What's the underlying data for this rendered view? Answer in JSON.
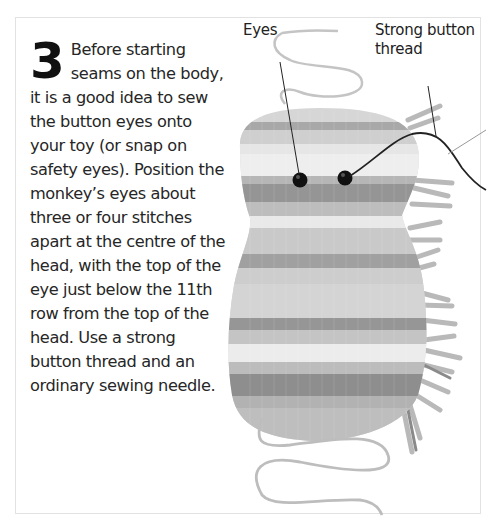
{
  "step": {
    "number": "3",
    "text": "Before starting seams on the body, it is a good idea to sew the button eyes onto your toy (or snap on safety eyes). Position the monkey’s eyes about three or four stitches apart at the centre of the head, with the top of the eye just below the 11th row from the top of the head. Use a strong button thread and an ordinary sewing needle."
  },
  "labels": {
    "eyes": "Eyes",
    "thread": "Strong button thread"
  },
  "colors": {
    "stripe_dark": "#8c8c8c",
    "stripe_mid": "#b4b4b4",
    "stripe_light": "#dcdcdc",
    "eye": "#111111",
    "text": "#262626"
  }
}
